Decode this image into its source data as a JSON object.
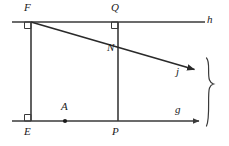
{
  "figure": {
    "width": 229,
    "height": 146,
    "stroke_color": "#3a3a3a",
    "label_color": "#1a1a1a",
    "background": "#ffffff"
  },
  "labels": {
    "F": "F",
    "Q": "Q",
    "h": "h",
    "N": "N",
    "j": "j",
    "g": "g",
    "A": "A",
    "E": "E",
    "P": "P"
  },
  "points": {
    "F": {
      "x": 31,
      "y": 22
    },
    "Q": {
      "x": 118,
      "y": 22
    },
    "N": {
      "x": 118,
      "y": 47
    },
    "E": {
      "x": 31,
      "y": 121
    },
    "P": {
      "x": 118,
      "y": 121
    },
    "A": {
      "x": 65,
      "y": 121
    }
  },
  "lines": {
    "h": {
      "name": "line-h",
      "x1": 12,
      "y1": 22,
      "x2": 205,
      "y2": 22,
      "arrow": false
    },
    "g": {
      "name": "line-g",
      "x1": 12,
      "y1": 121,
      "x2": 200,
      "y2": 121,
      "arrow": true
    },
    "j": {
      "name": "line-j",
      "x1": 31,
      "y1": 22,
      "x2": 196,
      "y2": 70,
      "arrow": true
    },
    "EF": {
      "name": "segment-EF",
      "x1": 31,
      "y1": 22,
      "x2": 31,
      "y2": 121,
      "arrow": false
    },
    "QP": {
      "name": "segment-QP",
      "x1": 118,
      "y1": 22,
      "x2": 118,
      "y2": 121,
      "arrow": false
    }
  },
  "right_angles": [
    {
      "name": "right-angle-F",
      "x": 31,
      "y": 22,
      "dx": -1,
      "dy": 1,
      "size": 6
    },
    {
      "name": "right-angle-Q",
      "x": 118,
      "y": 22,
      "dx": -1,
      "dy": 1,
      "size": 6
    },
    {
      "name": "right-angle-E",
      "x": 31,
      "y": 121,
      "dx": -1,
      "dy": -1,
      "size": 6
    }
  ],
  "brace": {
    "name": "curly-brace",
    "x": 208,
    "top": 58,
    "bottom": 126,
    "orientation": "right"
  }
}
